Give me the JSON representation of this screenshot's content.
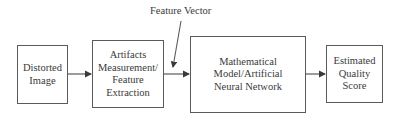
{
  "diagram": {
    "annotation": "Feature Vector",
    "nodes": [
      {
        "id": "distorted-image",
        "label": "Distorted\nImage"
      },
      {
        "id": "feature-extraction",
        "label": "Artifacts\nMeasurement/\nFeature\nExtraction"
      },
      {
        "id": "model",
        "label": "Mathematical\nModel/Artificial\nNeural Network"
      },
      {
        "id": "quality-score",
        "label": "Estimated\nQuality\nScore"
      }
    ],
    "edges": [
      {
        "from": "distorted-image",
        "to": "feature-extraction"
      },
      {
        "from": "feature-extraction",
        "to": "model"
      },
      {
        "from": "model",
        "to": "quality-score"
      }
    ],
    "colors": {
      "stroke": "#5a5a5a",
      "text": "#3a3a3a",
      "background": "#ffffff"
    }
  }
}
